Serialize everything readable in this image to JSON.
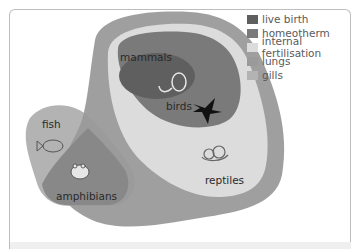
{
  "legend": {
    "items": [
      {
        "label": "live birth",
        "color": "#5f5f5f"
      },
      {
        "label": "homeotherm",
        "color": "#7a7a7a"
      },
      {
        "label": "internal fertilisation",
        "color": "#dcdcdc"
      },
      {
        "label": "lungs",
        "color": "#9a9a9a"
      },
      {
        "label": "gills",
        "color": "#b3b3b3"
      }
    ]
  },
  "groups": {
    "mammals": "mammals",
    "birds": "birds",
    "fish": "fish",
    "amphibians": "amphibians",
    "reptiles": "reptiles"
  },
  "icons": {
    "mammal": "rodent-icon",
    "bird": "swallow-icon",
    "fish": "fish-icon",
    "amphibian": "frog-icon",
    "reptile": "snake-icon"
  }
}
